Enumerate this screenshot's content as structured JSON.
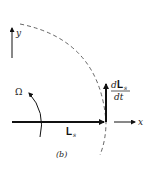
{
  "diagram": {
    "panel_label": "(b)",
    "axes": {
      "x_label": "x",
      "y_label": "y"
    },
    "vectors": {
      "L": {
        "symbol": "L",
        "subscript": "s"
      },
      "dLdt": {
        "numerator_d": "d",
        "numerator_symbol": "L",
        "numerator_subscript": "s",
        "denominator": "dt"
      }
    },
    "rotation": {
      "symbol": "Ω"
    },
    "colors": {
      "ink": "#111111",
      "dashed": "#555555",
      "background": "#ffffff"
    }
  }
}
